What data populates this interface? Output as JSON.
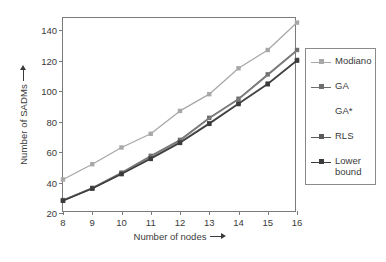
{
  "chart_data": {
    "type": "line",
    "title": "",
    "xlabel": "Number of nodes",
    "ylabel": "Number of SADMs",
    "xlabel_arrow": "right-arrow",
    "ylabel_arrow": "right-arrow",
    "x": [
      8,
      9,
      10,
      11,
      12,
      13,
      14,
      15,
      16
    ],
    "xlim": [
      8,
      16
    ],
    "ylim": [
      20,
      148
    ],
    "xticks": [
      8,
      9,
      10,
      11,
      12,
      13,
      14,
      15,
      16
    ],
    "yticks": [
      20,
      40,
      60,
      80,
      100,
      120,
      140
    ],
    "xtick_labels": [
      "8",
      "9",
      "10",
      "11",
      "12",
      "13",
      "14",
      "15",
      "16"
    ],
    "ytick_labels": [
      "20",
      "40",
      "60",
      "80",
      "100",
      "120",
      "140"
    ],
    "grid": false,
    "legend_position": "right-outside",
    "series": [
      {
        "name": "Modiano",
        "color": "#a8a8a8",
        "marker": "square",
        "values": [
          42,
          52,
          63,
          72,
          87,
          98,
          115,
          127,
          145
        ]
      },
      {
        "name": "GA",
        "color": "#6e6e6e",
        "marker": "square",
        "values": [
          28.5,
          36.5,
          46.5,
          57.5,
          68,
          82.5,
          95,
          111,
          127
        ]
      },
      {
        "name": "GA*",
        "color": "#7e7e7e",
        "marker": "none",
        "values": [
          28.5,
          36.3,
          46.2,
          57,
          67.5,
          82,
          94.5,
          110.5,
          126.5
        ]
      },
      {
        "name": "RLS",
        "color": "#5a5a5a",
        "marker": "square",
        "values": [
          28.2,
          36.2,
          45.8,
          56,
          66.5,
          79,
          92,
          105,
          120.5
        ]
      },
      {
        "name": "Lower bound",
        "color": "#3c3c3c",
        "marker": "square",
        "values": [
          28,
          36,
          45.5,
          55.5,
          66,
          78.5,
          91.5,
          104.5,
          120
        ]
      }
    ]
  },
  "legend": {
    "title": "",
    "items": [
      {
        "label": "Modiano",
        "key": "line-square-marker"
      },
      {
        "label": "GA",
        "key": "line-square-marker"
      },
      {
        "label": "GA*",
        "key": "none"
      },
      {
        "label": "RLS",
        "key": "line-square-marker"
      },
      {
        "label": "Lower bound",
        "label_line1": "Lower",
        "label_line2": "bound",
        "key": "line-square-marker"
      }
    ]
  },
  "axes": {
    "x_title": "Number of nodes",
    "y_title": "Number of SADMs"
  }
}
